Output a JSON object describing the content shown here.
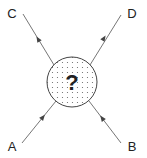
{
  "diagram": {
    "type": "scattering-vertex",
    "center_symbol": "?",
    "labels": {
      "top_left": "C",
      "top_right": "D",
      "bottom_left": "A",
      "bottom_right": "B"
    },
    "lines": [
      {
        "from": "A",
        "to": "center",
        "direction": "toward center"
      },
      {
        "from": "B",
        "to": "center",
        "direction": "toward center"
      },
      {
        "from": "center",
        "to": "C",
        "direction": "away from center"
      },
      {
        "from": "center",
        "to": "D",
        "direction": "away from center"
      }
    ],
    "colors": {
      "line": "#555555",
      "circle_stroke": "#444444",
      "dots": "#666666",
      "text": "#222222"
    }
  }
}
